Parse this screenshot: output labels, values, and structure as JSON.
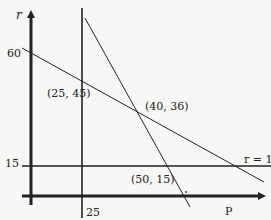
{
  "diagram": {
    "type": "economics-graph",
    "axes": {
      "y_label": "r",
      "x_label": "P"
    },
    "ticks": {
      "y_60": "60",
      "y_15": "15",
      "x_25": "25"
    },
    "lines": {
      "horizontal_label": "r = 15",
      "vertical_value": "P = 25",
      "shallow_line_intercept": "60",
      "steep_line": "downward sloping line"
    },
    "points": [
      {
        "label": "(25, 45)",
        "P": 25,
        "r": 45
      },
      {
        "label": "(40, 36)",
        "P": 40,
        "r": 36
      },
      {
        "label": "(50, 15)",
        "P": 50,
        "r": 15
      }
    ],
    "colors": {
      "ink": "#222222",
      "paper": "#f7f7f5"
    }
  }
}
